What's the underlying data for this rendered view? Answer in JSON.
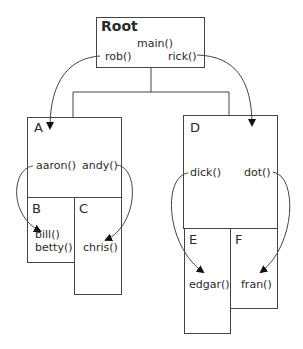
{
  "diagram": {
    "type": "call-tree / nested scope diagram",
    "line_color": "#444444",
    "background": "#ffffff",
    "nodes": {
      "root": {
        "label": "Root",
        "functions": [
          "main()",
          "rob()",
          "rick()"
        ]
      },
      "a": {
        "label": "A",
        "functions": [
          "aaron()",
          "andy()"
        ]
      },
      "b": {
        "label": "B",
        "functions": [
          "bill()",
          "betty()"
        ]
      },
      "c": {
        "label": "C",
        "functions": [
          "chris()"
        ]
      },
      "d": {
        "label": "D",
        "functions": [
          "dick()",
          "dot()"
        ]
      },
      "e": {
        "label": "E",
        "functions": [
          "edgar()"
        ]
      },
      "f": {
        "label": "F",
        "functions": [
          "fran()"
        ]
      }
    },
    "tree_edges": [
      {
        "from": "Root",
        "to": "A"
      },
      {
        "from": "Root",
        "to": "D"
      }
    ],
    "nested": [
      {
        "parent": "A",
        "children": [
          "B",
          "C"
        ]
      },
      {
        "parent": "D",
        "children": [
          "E",
          "F"
        ]
      }
    ],
    "call_arrows": [
      {
        "from": "rob()",
        "to": "A"
      },
      {
        "from": "rick()",
        "to": "D"
      },
      {
        "from": "aaron()",
        "to": "bill()"
      },
      {
        "from": "andy()",
        "to": "chris()"
      },
      {
        "from": "dick()",
        "to": "edgar()"
      },
      {
        "from": "dot()",
        "to": "fran()"
      }
    ]
  }
}
